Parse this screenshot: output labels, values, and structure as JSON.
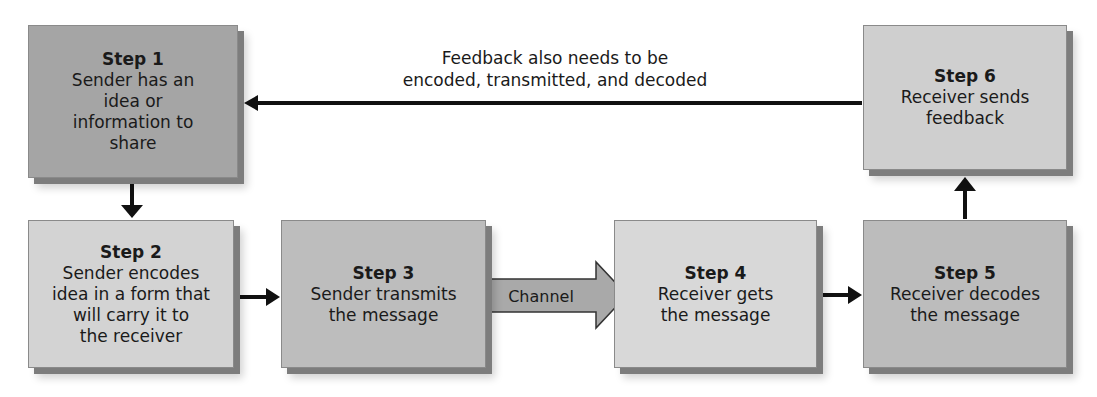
{
  "diagram": {
    "feedback_label": {
      "line1": "Feedback also needs to be",
      "line2": "encoded, transmitted, and decoded"
    },
    "channel_label": "Channel",
    "colors": {
      "step1": "#a5a5a5",
      "step2": "#d3d3d3",
      "step3": "#bdbdbd",
      "step4": "#d8d8d8",
      "step5": "#bcbcbc",
      "step6": "#cfcfcf",
      "channel": "#a9a9a9",
      "arrow": "#111111"
    },
    "steps": [
      {
        "title": "Step 1",
        "lines": [
          "Sender has an",
          "idea or",
          "information to",
          "share"
        ]
      },
      {
        "title": "Step 2",
        "lines": [
          "Sender encodes",
          "idea in a form that",
          "will carry it to",
          "the receiver"
        ]
      },
      {
        "title": "Step 3",
        "lines": [
          "Sender transmits",
          "the message"
        ]
      },
      {
        "title": "Step 4",
        "lines": [
          "Receiver gets",
          "the message"
        ]
      },
      {
        "title": "Step 5",
        "lines": [
          "Receiver decodes",
          "the message"
        ]
      },
      {
        "title": "Step 6",
        "lines": [
          "Receiver sends",
          "feedback"
        ]
      }
    ]
  }
}
